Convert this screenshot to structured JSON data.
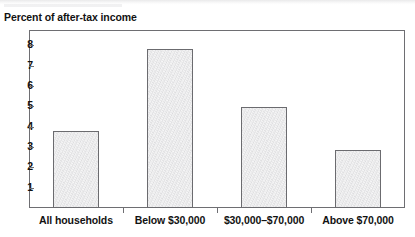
{
  "chart_data": {
    "type": "bar",
    "title": "Percent of after-tax income",
    "xlabel": "",
    "ylabel": "Percent of after-tax income",
    "categories": [
      "All households",
      "Below $30,000",
      "$30,000–$70,000",
      "Above $70,000"
    ],
    "values": [
      3.8,
      7.8,
      4.95,
      2.85
    ],
    "ylim": [
      0,
      8.75
    ],
    "yticks": [
      1,
      2,
      3,
      4,
      5,
      6,
      7,
      8
    ],
    "ytick_labels": [
      "1",
      "2",
      "3",
      "4",
      "5",
      "6",
      "7",
      "8"
    ],
    "grid": false,
    "legend": null,
    "legend_position": "none",
    "bar_fill_color": "#e7e7e8",
    "bar_border_color": "#6b6b6f",
    "frame_color": "#6e6e72",
    "text_color": "#121212"
  },
  "figure": {
    "axis_title": "Percent of after-tax income",
    "background_color": "#ffffff"
  }
}
